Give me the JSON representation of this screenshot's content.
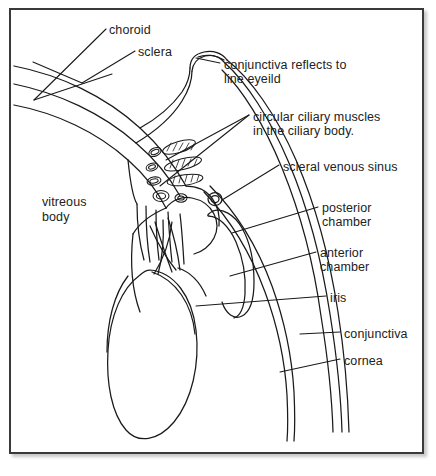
{
  "figure": {
    "frame": {
      "border_color": "#3a3a3a",
      "background_color": "#ffffff",
      "shadow": true
    },
    "ink_color": "#1a1a1a",
    "text_color": "#222222"
  },
  "labels": [
    {
      "id": "choroid",
      "text": "choroid",
      "x": 109,
      "y": 23
    },
    {
      "id": "sclera",
      "text": "sclera",
      "x": 138,
      "y": 45
    },
    {
      "id": "conjunctiva-fornix",
      "text": "conjunctiva reflects to",
      "x": 224,
      "y": 58
    },
    {
      "id": "conjunctiva-fornix-2",
      "text": "line eyeild",
      "x": 224,
      "y": 72
    },
    {
      "id": "ciliary-muscles",
      "text": "circular ciliary muscles",
      "x": 253,
      "y": 110
    },
    {
      "id": "ciliary-muscles-2",
      "text": "in the ciliary body.",
      "x": 253,
      "y": 124
    },
    {
      "id": "scleral-venous-sinus",
      "text": "scleral venous sinus",
      "x": 283,
      "y": 160
    },
    {
      "id": "posterior-chamber",
      "text": "posterior",
      "x": 322,
      "y": 201
    },
    {
      "id": "posterior-chamber-2",
      "text": "chamber",
      "x": 322,
      "y": 215
    },
    {
      "id": "anterior-chamber",
      "text": "anterior",
      "x": 320,
      "y": 246
    },
    {
      "id": "anterior-chamber-2",
      "text": "chamber",
      "x": 320,
      "y": 260
    },
    {
      "id": "iris",
      "text": "iris",
      "x": 330,
      "y": 291
    },
    {
      "id": "conjunctiva",
      "text": "conjunctiva",
      "x": 344,
      "y": 327
    },
    {
      "id": "cornea",
      "text": "cornea",
      "x": 344,
      "y": 354
    },
    {
      "id": "vitreous-body",
      "text": "vitreous",
      "x": 42,
      "y": 195
    },
    {
      "id": "vitreous-body-2",
      "text": "body",
      "x": 42,
      "y": 210
    }
  ],
  "structures": [
    "choroid",
    "sclera",
    "conjunctiva",
    "conjunctival fornix",
    "circular ciliary muscles",
    "ciliary body",
    "scleral venous sinus",
    "posterior chamber",
    "anterior chamber",
    "iris",
    "cornea",
    "vitreous body",
    "lens",
    "suspensory ligaments"
  ]
}
